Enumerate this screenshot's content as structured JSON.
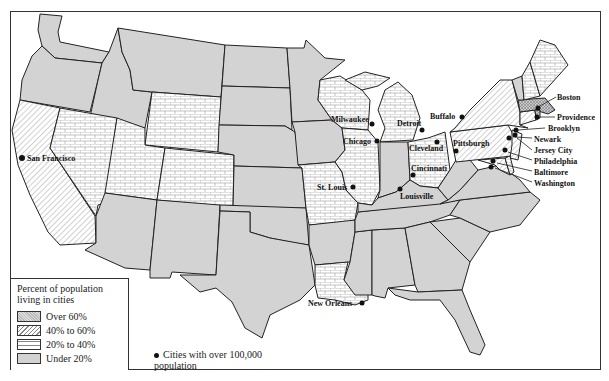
{
  "map": {
    "title": "Percent of population living in cities",
    "legend": {
      "title": "Percent of population living in cities",
      "categories": [
        {
          "label": "Over 60%",
          "pattern": "crosshatch",
          "color": "#b0b0b0"
        },
        {
          "label": "40% to 60%",
          "pattern": "diagonal-lines",
          "color": "#ffffff"
        },
        {
          "label": "20% to 40%",
          "pattern": "brick",
          "color": "#ffffff"
        },
        {
          "label": "Under 20%",
          "pattern": "solid-gray",
          "color": "#d3d3d3"
        }
      ],
      "cities_note": "Cities with over 100,000 population"
    },
    "cities": [
      {
        "name": "San Francisco"
      },
      {
        "name": "Milwaukee"
      },
      {
        "name": "Chicago"
      },
      {
        "name": "Detroit"
      },
      {
        "name": "Buffalo"
      },
      {
        "name": "Cleveland"
      },
      {
        "name": "Pittsburgh"
      },
      {
        "name": "Cincinnati"
      },
      {
        "name": "St. Louis"
      },
      {
        "name": "Louisville"
      },
      {
        "name": "New Orleans"
      },
      {
        "name": "Boston"
      },
      {
        "name": "Providence"
      },
      {
        "name": "Brooklyn"
      },
      {
        "name": "Newark"
      },
      {
        "name": "Jersey City"
      },
      {
        "name": "Philadelphia"
      },
      {
        "name": "Baltimore"
      },
      {
        "name": "Washington"
      }
    ],
    "states_by_category": {
      "Over 60%": [
        "Massachusetts",
        "Rhode Island"
      ],
      "40% to 60%": [
        "California",
        "New York",
        "Pennsylvania",
        "New Jersey",
        "Connecticut",
        "Maryland"
      ],
      "20% to 40%": [
        "Nevada",
        "Utah",
        "Wyoming",
        "Colorado",
        "Wisconsin",
        "Michigan",
        "Illinois",
        "Missouri",
        "Ohio",
        "Louisiana",
        "Maine",
        "New Hampshire",
        "Delaware"
      ],
      "Under 20%": [
        "Washington",
        "Oregon",
        "Idaho",
        "Montana",
        "North Dakota",
        "South Dakota",
        "Nebraska",
        "Kansas",
        "Oklahoma",
        "Texas",
        "New Mexico",
        "Arizona",
        "Minnesota",
        "Iowa",
        "Arkansas",
        "Mississippi",
        "Alabama",
        "Georgia",
        "Florida",
        "Tennessee",
        "Kentucky",
        "Indiana",
        "West Virginia",
        "Virginia",
        "North Carolina",
        "South Carolina",
        "Vermont"
      ]
    }
  }
}
